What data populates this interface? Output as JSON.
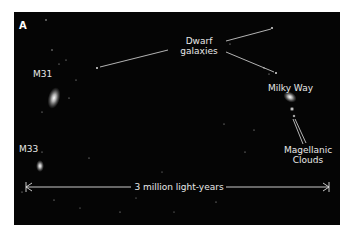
{
  "figure": {
    "panel_label": "A",
    "background_color": "#050505",
    "text_color": "#e8e8e8"
  },
  "labels": {
    "m31": "M31",
    "m33": "M33",
    "milky_way": "Milky Way",
    "dwarf_line1": "Dwarf",
    "dwarf_line2": "galaxies",
    "magellanic_line1": "Magellanic",
    "magellanic_line2": "Clouds",
    "scale": "3 million light-years"
  }
}
